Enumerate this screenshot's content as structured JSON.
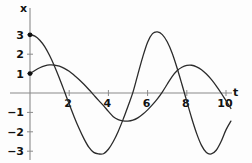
{
  "chart_data": {
    "type": "line",
    "title": "",
    "xlabel": "t",
    "ylabel": "x",
    "xlim": [
      -0.55,
      10.6
    ],
    "ylim": [
      -3.6,
      3.6
    ],
    "grid": false,
    "legend": null,
    "xticks": [
      2,
      4,
      6,
      8,
      10
    ],
    "yticks": [
      3,
      2,
      1,
      -1,
      -2,
      -3
    ],
    "xtick_labels": [
      "2",
      "4",
      "6",
      "8",
      "10"
    ],
    "ytick_labels": [
      "3",
      "2",
      "1",
      "−1",
      "−2",
      "−3"
    ],
    "annotations": [
      {
        "label": "initial point",
        "x": 0,
        "y": 3
      },
      {
        "label": "initial point",
        "x": 0,
        "y": 1
      }
    ],
    "series": [
      {
        "name": "curve-1",
        "color": "#2b2b2b",
        "amplitude": 3.15,
        "period": 6.0,
        "phase_at_zero": 3.0,
        "x_start": 0,
        "x_end": 10.25,
        "points": [
          [
            0.0,
            3.0
          ],
          [
            0.25,
            2.93
          ],
          [
            0.5,
            2.72
          ],
          [
            0.75,
            2.39
          ],
          [
            1.0,
            1.93
          ],
          [
            1.25,
            1.38
          ],
          [
            1.5,
            0.76
          ],
          [
            1.75,
            0.1
          ],
          [
            2.0,
            -0.57
          ],
          [
            2.25,
            -1.22
          ],
          [
            2.5,
            -1.82
          ],
          [
            2.75,
            -2.35
          ],
          [
            3.0,
            -2.79
          ],
          [
            3.25,
            -3.06
          ],
          [
            3.5,
            -3.14
          ],
          [
            3.75,
            -3.13
          ],
          [
            4.0,
            -2.9
          ],
          [
            4.25,
            -2.5
          ],
          [
            4.5,
            -1.98
          ],
          [
            4.75,
            -1.36
          ],
          [
            5.0,
            -0.68
          ],
          [
            5.25,
            0.03
          ],
          [
            5.5,
            0.95
          ],
          [
            5.75,
            1.85
          ],
          [
            6.0,
            2.62
          ],
          [
            6.25,
            3.06
          ],
          [
            6.5,
            3.15
          ],
          [
            6.75,
            3.01
          ],
          [
            7.0,
            2.64
          ],
          [
            7.25,
            2.06
          ],
          [
            7.5,
            1.3
          ],
          [
            7.75,
            0.45
          ],
          [
            8.0,
            -0.43
          ],
          [
            8.25,
            -1.3
          ],
          [
            8.5,
            -2.08
          ],
          [
            8.75,
            -2.7
          ],
          [
            9.0,
            -3.07
          ],
          [
            9.25,
            -3.14
          ],
          [
            9.5,
            -2.95
          ],
          [
            9.75,
            -2.5
          ],
          [
            10.0,
            -1.9
          ],
          [
            10.25,
            -1.45
          ]
        ]
      },
      {
        "name": "curve-2",
        "color": "#2b2b2b",
        "amplitude": 1.45,
        "period": 8.6,
        "phase_at_zero": 1.0,
        "x_start": 0,
        "x_end": 10.25,
        "points": [
          [
            0.0,
            1.0
          ],
          [
            0.25,
            1.16
          ],
          [
            0.5,
            1.3
          ],
          [
            0.75,
            1.4
          ],
          [
            1.0,
            1.45
          ],
          [
            1.25,
            1.44
          ],
          [
            1.5,
            1.38
          ],
          [
            1.75,
            1.27
          ],
          [
            2.0,
            1.12
          ],
          [
            2.25,
            0.92
          ],
          [
            2.5,
            0.7
          ],
          [
            2.75,
            0.45
          ],
          [
            3.0,
            0.18
          ],
          [
            3.25,
            -0.1
          ],
          [
            3.5,
            -0.38
          ],
          [
            3.75,
            -0.65
          ],
          [
            4.0,
            -0.95
          ],
          [
            4.25,
            -1.22
          ],
          [
            4.5,
            -1.37
          ],
          [
            4.75,
            -1.44
          ],
          [
            5.0,
            -1.45
          ],
          [
            5.25,
            -1.4
          ],
          [
            5.5,
            -1.28
          ],
          [
            5.75,
            -1.1
          ],
          [
            6.0,
            -0.87
          ],
          [
            6.25,
            -0.6
          ],
          [
            6.5,
            -0.3
          ],
          [
            6.75,
            0.05
          ],
          [
            7.0,
            0.45
          ],
          [
            7.25,
            0.85
          ],
          [
            7.5,
            1.15
          ],
          [
            7.75,
            1.33
          ],
          [
            8.0,
            1.42
          ],
          [
            8.25,
            1.43
          ],
          [
            8.5,
            1.35
          ],
          [
            8.75,
            1.2
          ],
          [
            9.0,
            0.98
          ],
          [
            9.25,
            0.7
          ],
          [
            9.5,
            0.37
          ],
          [
            9.75,
            0.0
          ],
          [
            10.0,
            -0.4
          ],
          [
            10.25,
            -0.8
          ]
        ]
      }
    ]
  },
  "axes": {
    "x_axis_label": "t",
    "y_axis_label": "x"
  }
}
